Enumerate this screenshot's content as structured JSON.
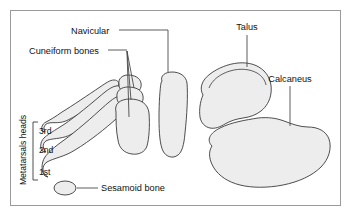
{
  "figure": {
    "type": "anatomical-diagram",
    "background_color": "#ffffff",
    "frame_color": "#9a9a9a",
    "bone_fill_color": "#ededed",
    "bone_outline_color": "#3a3a3a",
    "leader_color": "#4a4a4a"
  },
  "labels": {
    "navicular": "Navicular",
    "cuneiform_bones": "Cuneiform bones",
    "talus": "Talus",
    "calcaneus": "Calcaneus",
    "sesamoid_bone": "Sesamoid bone",
    "metatarsals_heads": "Metatarsals heads",
    "metatarsal_3rd": "3rd",
    "metatarsal_2nd": "2nd",
    "metatarsal_1st": "1st"
  },
  "structures": [
    {
      "name": "Navicular",
      "count": 1,
      "label_position": "top-left"
    },
    {
      "name": "Cuneiform bones",
      "count": 3,
      "label_position": "left"
    },
    {
      "name": "Talus",
      "count": 1,
      "label_position": "top-right"
    },
    {
      "name": "Calcaneus",
      "count": 1,
      "label_position": "right"
    },
    {
      "name": "Sesamoid bone",
      "count": 1,
      "label_position": "bottom-left"
    },
    {
      "name": "Metatarsals heads",
      "count": 3,
      "label_position": "left-vertical"
    }
  ]
}
